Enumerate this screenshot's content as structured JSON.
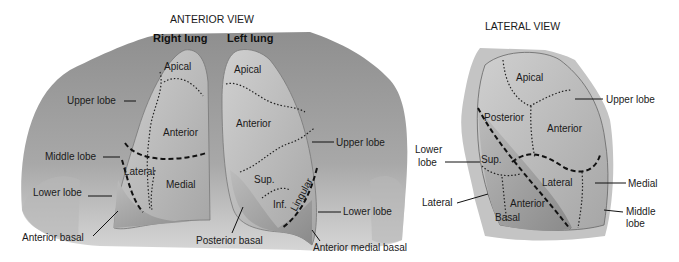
{
  "anterior_view": {
    "title": "ANTERIOR VIEW",
    "right_lung_heading": "Right lung",
    "left_lung_heading": "Left lung",
    "right_lung": {
      "segments": [
        "Apical",
        "Anterior",
        "Lateral",
        "Medial"
      ],
      "callouts": [
        "Upper lobe",
        "Middle lobe",
        "Lower lobe",
        "Anterior basal"
      ]
    },
    "left_lung": {
      "segments": [
        "Apical",
        "Anterior",
        "Sup.",
        "Inf.",
        "Lingular"
      ],
      "callouts": [
        "Upper lobe",
        "Lower lobe",
        "Posterior basal",
        "Anterior medial basal"
      ]
    }
  },
  "lateral_view": {
    "title": "LATERAL VIEW",
    "segments": [
      "Apical",
      "Posterior",
      "Anterior",
      "Sup.",
      "Lateral",
      "Anterior",
      "Basal"
    ],
    "callouts": {
      "upper_lobe": "Upper lobe",
      "lower_lobe_line1": "Lower",
      "lower_lobe_line2": "lobe",
      "lateral": "Lateral",
      "medial": "Medial",
      "middle_lobe_line1": "Middle",
      "middle_lobe_line2": "lobe"
    }
  },
  "colors": {
    "background": "#ffffff",
    "body_tone": "#a9a9a9",
    "lung_tone": "#bdbdbd",
    "lower_lobe_tone": "#9c9c9c",
    "text": "#1a1a1a"
  }
}
